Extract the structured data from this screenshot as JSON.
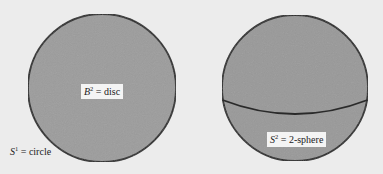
{
  "figure": {
    "background": "#ececec",
    "fill_color": "#9c9c9c",
    "stroke_color": "#2a2a2a",
    "disc": {
      "cx": 102,
      "cy": 88,
      "r": 74,
      "label": {
        "symbol": "B",
        "superscript": "2",
        "text": " = disc"
      },
      "boundary_label": {
        "symbol": "S",
        "superscript": "1",
        "text": " = circle"
      }
    },
    "sphere": {
      "cx": 295,
      "cy": 88,
      "r": 73,
      "equator": true,
      "label": {
        "symbol": "S",
        "superscript": "2",
        "text": " = 2-sphere"
      }
    }
  }
}
